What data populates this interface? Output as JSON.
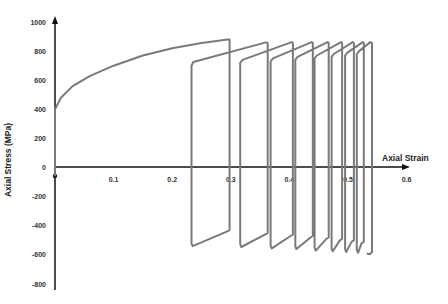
{
  "chart_data": {
    "type": "line",
    "title": "",
    "xlabel": "Axial Strain",
    "ylabel": "Axial Stress (MPa)",
    "xlim": [
      0,
      0.6
    ],
    "ylim": [
      -800,
      1000
    ],
    "x_ticks": [
      "0.1",
      "0.2",
      "0.3",
      "0.4",
      "0.5",
      "0.6"
    ],
    "x_tick_values": [
      0.1,
      0.2,
      0.3,
      0.4,
      0.5,
      0.6
    ],
    "y_ticks": [
      "1000",
      "800",
      "600",
      "400",
      "200",
      "0",
      "-200",
      "-400",
      "-600",
      "-800"
    ],
    "y_tick_values": [
      1000,
      800,
      600,
      400,
      200,
      0,
      -200,
      -400,
      -600,
      -800
    ],
    "grid": false,
    "legend": null,
    "line_color": "#7a7a7a",
    "series": [
      {
        "name": "cyclic stress-strain",
        "points": [
          [
            0,
            -60
          ],
          [
            0,
            0
          ],
          [
            0,
            400
          ],
          [
            0.01,
            480
          ],
          [
            0.03,
            560
          ],
          [
            0.06,
            630
          ],
          [
            0.1,
            700
          ],
          [
            0.15,
            770
          ],
          [
            0.2,
            820
          ],
          [
            0.25,
            855
          ],
          [
            0.295,
            880
          ],
          [
            0.298,
            880
          ],
          [
            0.298,
            -430
          ],
          [
            0.293,
            -440
          ],
          [
            0.235,
            -540
          ],
          [
            0.233,
            -520
          ],
          [
            0.233,
            700
          ],
          [
            0.236,
            725
          ],
          [
            0.36,
            860
          ],
          [
            0.363,
            855
          ],
          [
            0.363,
            -450
          ],
          [
            0.358,
            -460
          ],
          [
            0.318,
            -545
          ],
          [
            0.316,
            -525
          ],
          [
            0.316,
            720
          ],
          [
            0.32,
            740
          ],
          [
            0.404,
            862
          ],
          [
            0.406,
            855
          ],
          [
            0.406,
            -460
          ],
          [
            0.402,
            -470
          ],
          [
            0.37,
            -555
          ],
          [
            0.368,
            -535
          ],
          [
            0.368,
            730
          ],
          [
            0.372,
            750
          ],
          [
            0.438,
            862
          ],
          [
            0.44,
            855
          ],
          [
            0.44,
            -470
          ],
          [
            0.436,
            -480
          ],
          [
            0.412,
            -560
          ],
          [
            0.41,
            -540
          ],
          [
            0.41,
            740
          ],
          [
            0.414,
            760
          ],
          [
            0.465,
            862
          ],
          [
            0.467,
            855
          ],
          [
            0.467,
            -480
          ],
          [
            0.463,
            -490
          ],
          [
            0.445,
            -570
          ],
          [
            0.443,
            -550
          ],
          [
            0.443,
            750
          ],
          [
            0.447,
            770
          ],
          [
            0.488,
            862
          ],
          [
            0.49,
            855
          ],
          [
            0.49,
            -490
          ],
          [
            0.486,
            -500
          ],
          [
            0.474,
            -575
          ],
          [
            0.472,
            -555
          ],
          [
            0.472,
            760
          ],
          [
            0.476,
            780
          ],
          [
            0.508,
            862
          ],
          [
            0.51,
            855
          ],
          [
            0.51,
            -500
          ],
          [
            0.506,
            -510
          ],
          [
            0.497,
            -580
          ],
          [
            0.495,
            -560
          ],
          [
            0.495,
            770
          ],
          [
            0.499,
            790
          ],
          [
            0.525,
            862
          ],
          [
            0.527,
            855
          ],
          [
            0.527,
            -510
          ],
          [
            0.523,
            -520
          ],
          [
            0.517,
            -585
          ],
          [
            0.515,
            -565
          ],
          [
            0.515,
            780
          ],
          [
            0.519,
            800
          ],
          [
            0.538,
            862
          ],
          [
            0.541,
            855
          ],
          [
            0.541,
            -580
          ],
          [
            0.537,
            -595
          ],
          [
            0.532,
            -590
          ]
        ]
      }
    ]
  }
}
